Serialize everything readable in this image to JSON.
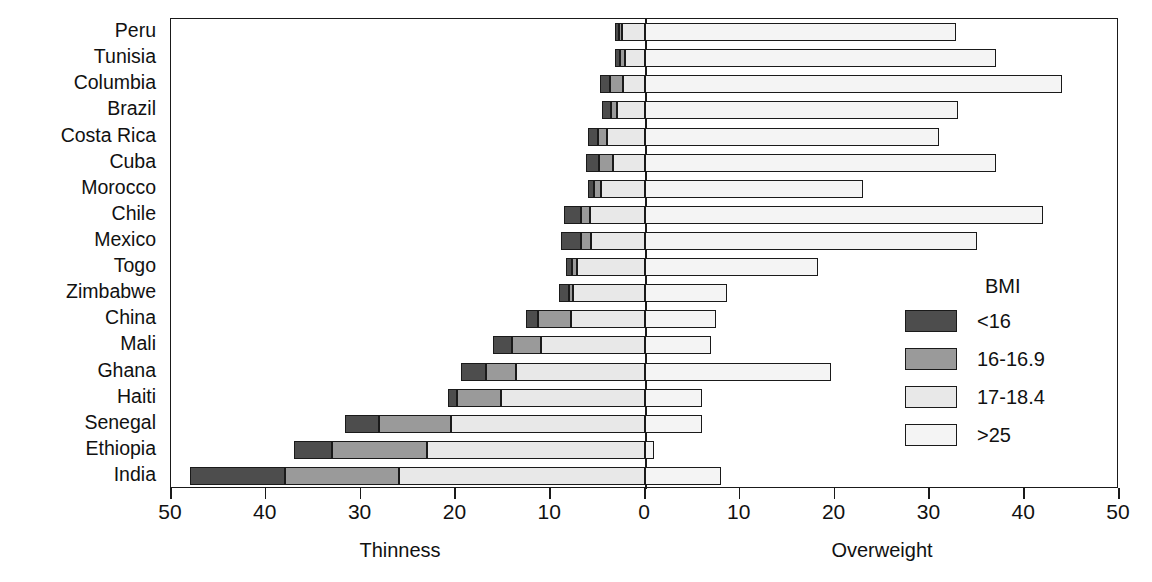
{
  "chart_data": {
    "type": "bar",
    "title": "",
    "subtitle": "",
    "orientation": "horizontal",
    "stacked": true,
    "diverging": true,
    "xlabel_left": "Thinness",
    "xlabel_right": "Overweight",
    "ylabel": "",
    "xlim": [
      -50,
      50
    ],
    "xticks": [
      -50,
      -40,
      -30,
      -20,
      -10,
      0,
      10,
      20,
      30,
      40,
      50
    ],
    "xticklabels": [
      "50",
      "40",
      "30",
      "20",
      "10",
      "0",
      "10",
      "20",
      "30",
      "40",
      "50"
    ],
    "grid": false,
    "legend_title": "BMI",
    "legend_position": "right-inside",
    "series": [
      {
        "name": "<16",
        "color": "#4d4d4d",
        "side": "left"
      },
      {
        "name": "16-16.9",
        "color": "#9a9a9a",
        "side": "left"
      },
      {
        "name": "17-18.4",
        "color": "#e8e8e8",
        "side": "left"
      },
      {
        "name": ">25",
        "color": "#f4f4f4",
        "side": "right"
      }
    ],
    "categories": [
      "Peru",
      "Tunisia",
      "Columbia",
      "Brazil",
      "Costa Rica",
      "Cuba",
      "Morocco",
      "Chile",
      "Mexico",
      "Togo",
      "Zimbabwe",
      "China",
      "Mali",
      "Ghana",
      "Haiti",
      "Senegal",
      "Ethiopia",
      "India"
    ],
    "rows": [
      {
        "country": "Peru",
        "lt16": 0.5,
        "b16_169": 0.3,
        "b17_184": 2.4,
        "gt25": 32.8
      },
      {
        "country": "Tunisia",
        "lt16": 0.6,
        "b16_169": 0.5,
        "b17_184": 2.1,
        "gt25": 37.0
      },
      {
        "country": "Columbia",
        "lt16": 1.0,
        "b16_169": 1.4,
        "b17_184": 2.3,
        "gt25": 44.0
      },
      {
        "country": "Brazil",
        "lt16": 0.9,
        "b16_169": 0.6,
        "b17_184": 3.0,
        "gt25": 33.0
      },
      {
        "country": "Costa Rica",
        "lt16": 1.0,
        "b16_169": 1.0,
        "b17_184": 4.0,
        "gt25": 31.0
      },
      {
        "country": "Cuba",
        "lt16": 1.4,
        "b16_169": 1.4,
        "b17_184": 3.4,
        "gt25": 37.0
      },
      {
        "country": "Morocco",
        "lt16": 0.6,
        "b16_169": 0.8,
        "b17_184": 4.6,
        "gt25": 23.0
      },
      {
        "country": "Chile",
        "lt16": 1.8,
        "b16_169": 0.9,
        "b17_184": 5.8,
        "gt25": 42.0
      },
      {
        "country": "Mexico",
        "lt16": 2.1,
        "b16_169": 1.1,
        "b17_184": 5.7,
        "gt25": 35.0
      },
      {
        "country": "Togo",
        "lt16": 0.6,
        "b16_169": 0.5,
        "b17_184": 7.2,
        "gt25": 18.3
      },
      {
        "country": "Zimbabwe",
        "lt16": 1.1,
        "b16_169": 0.4,
        "b17_184": 7.6,
        "gt25": 8.7
      },
      {
        "country": "China",
        "lt16": 1.3,
        "b16_169": 3.5,
        "b17_184": 7.8,
        "gt25": 7.5
      },
      {
        "country": "Mali",
        "lt16": 2.0,
        "b16_169": 3.0,
        "b17_184": 11.0,
        "gt25": 7.0
      },
      {
        "country": "Ghana",
        "lt16": 2.6,
        "b16_169": 3.2,
        "b17_184": 13.6,
        "gt25": 19.6
      },
      {
        "country": "Haiti",
        "lt16": 1.0,
        "b16_169": 4.6,
        "b17_184": 15.2,
        "gt25": 6.0
      },
      {
        "country": "Senegal",
        "lt16": 3.5,
        "b16_169": 7.6,
        "b17_184": 20.5,
        "gt25": 6.0
      },
      {
        "country": "Ethiopia",
        "lt16": 4.0,
        "b16_169": 10.0,
        "b17_184": 23.0,
        "gt25": 1.0
      },
      {
        "country": "India",
        "lt16": 10.0,
        "b16_169": 12.0,
        "b17_184": 26.0,
        "gt25": 8.0
      }
    ]
  },
  "legend": {
    "title": "BMI",
    "items": [
      {
        "label": "<16"
      },
      {
        "label": "16-16.9"
      },
      {
        "label": "17-18.4"
      },
      {
        "label": ">25"
      }
    ]
  },
  "axis": {
    "left_title": "Thinness",
    "right_title": "Overweight",
    "ticklabels": [
      "50",
      "40",
      "30",
      "20",
      "10",
      "0",
      "10",
      "20",
      "30",
      "40",
      "50"
    ]
  }
}
